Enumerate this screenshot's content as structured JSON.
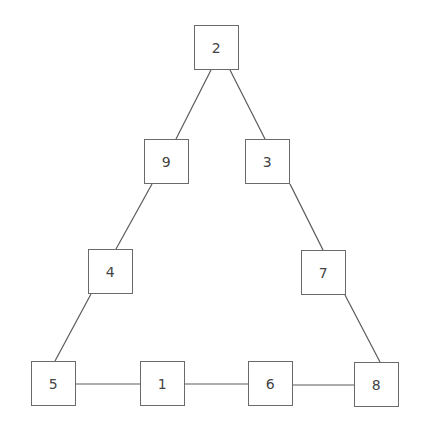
{
  "diagram": {
    "type": "triangle-number-puzzle",
    "colors": {
      "line": "#5a5a5a",
      "box_border": "#6a6a6a",
      "text": "#444444",
      "background": "#ffffff"
    },
    "nodes": [
      {
        "id": "n2",
        "label": "2",
        "x": 194,
        "y": 25
      },
      {
        "id": "n9",
        "label": "9",
        "x": 144,
        "y": 139
      },
      {
        "id": "n3",
        "label": "3",
        "x": 245,
        "y": 139
      },
      {
        "id": "n4",
        "label": "4",
        "x": 88,
        "y": 249
      },
      {
        "id": "n7",
        "label": "7",
        "x": 301,
        "y": 250
      },
      {
        "id": "n5",
        "label": "5",
        "x": 31,
        "y": 361
      },
      {
        "id": "n1",
        "label": "1",
        "x": 140,
        "y": 361
      },
      {
        "id": "n6",
        "label": "6",
        "x": 248,
        "y": 361
      },
      {
        "id": "n8",
        "label": "8",
        "x": 354,
        "y": 362
      }
    ],
    "edges": [
      {
        "from": "2",
        "to": "9",
        "x1": 211,
        "y1": 70,
        "x2": 176,
        "y2": 139
      },
      {
        "from": "2",
        "to": "3",
        "x1": 230,
        "y1": 70,
        "x2": 265,
        "y2": 139
      },
      {
        "from": "9",
        "to": "4",
        "x1": 152,
        "y1": 184,
        "x2": 116,
        "y2": 249
      },
      {
        "from": "3",
        "to": "7",
        "x1": 290,
        "y1": 184,
        "x2": 323,
        "y2": 250
      },
      {
        "from": "4",
        "to": "5",
        "x1": 91,
        "y1": 294,
        "x2": 55,
        "y2": 361
      },
      {
        "from": "7",
        "to": "8",
        "x1": 345,
        "y1": 295,
        "x2": 380,
        "y2": 362
      },
      {
        "from": "5",
        "to": "1",
        "x1": 76,
        "y1": 384,
        "x2": 140,
        "y2": 384
      },
      {
        "from": "1",
        "to": "6",
        "x1": 185,
        "y1": 384,
        "x2": 248,
        "y2": 384
      },
      {
        "from": "6",
        "to": "8",
        "x1": 293,
        "y1": 385,
        "x2": 354,
        "y2": 385
      }
    ]
  }
}
